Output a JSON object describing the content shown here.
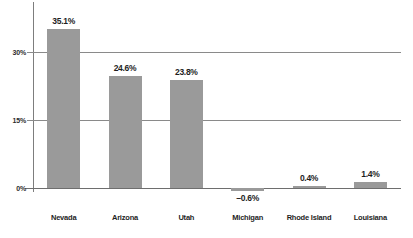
{
  "chart_data": {
    "type": "bar",
    "title": "",
    "subtitle": "",
    "xlabel": "",
    "ylabel": "",
    "categories": [
      "Nevada",
      "Arizona",
      "Utah",
      "Michigan",
      "Rhode Island",
      "Louisiana"
    ],
    "values": [
      35.1,
      24.6,
      23.8,
      -0.6,
      0.4,
      1.4
    ],
    "value_labels": [
      "35.1%",
      "24.6%",
      "23.8%",
      "–0.6%",
      "0.4%",
      "1.4%"
    ],
    "ylim": [
      -3,
      38
    ],
    "yticks": [
      0,
      15,
      30
    ],
    "ytick_labels": [
      "0%",
      "15%",
      "30%"
    ],
    "grid": true,
    "legend": null,
    "orientation": "vertical",
    "bar_color": "#9a9a9a",
    "gridline_color": "#8a8a8a",
    "axis_color": "#6e6e6e",
    "text_color": "#1e1e1e",
    "background": "#ffffff"
  }
}
